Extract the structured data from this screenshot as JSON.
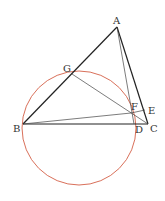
{
  "diagram": {
    "type": "geometry",
    "colors": {
      "lines": "#222222",
      "thin_lines": "#444444",
      "circle": "#d9705a"
    },
    "circle": {
      "cx": 79,
      "cy": 128,
      "r": 57
    },
    "points": {
      "A": {
        "label": "A",
        "x": 117,
        "y": 27
      },
      "B": {
        "label": "B",
        "x": 23,
        "y": 124
      },
      "C": {
        "label": "C",
        "x": 148,
        "y": 124
      },
      "D": {
        "label": "D",
        "x": 134,
        "y": 124
      },
      "E": {
        "label": "E",
        "x": 145,
        "y": 110
      },
      "F": {
        "label": "F",
        "x": 131,
        "y": 113
      },
      "G": {
        "label": "G",
        "x": 72,
        "y": 74
      }
    },
    "segments": [
      "AB",
      "AC",
      "BC",
      "AF",
      "AD",
      "BF",
      "GC",
      "FE"
    ]
  }
}
